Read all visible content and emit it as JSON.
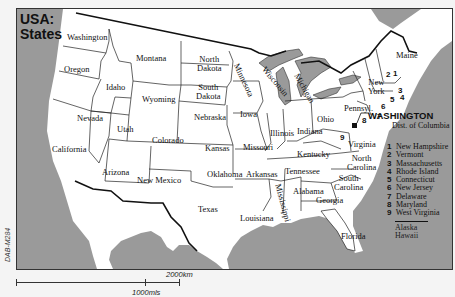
{
  "title": {
    "line1": "USA:",
    "line2": "States"
  },
  "colors": {
    "water": "#9a9a9a",
    "land": "#ffffff",
    "border": "#111111",
    "background": "#f4f4f4"
  },
  "states": {
    "washington": "Washington",
    "oregon": "Oregon",
    "california": "California",
    "nevada": "Nevada",
    "idaho": "Idaho",
    "montana": "Montana",
    "wyoming": "Wyoming",
    "utah": "Utah",
    "arizona": "Arizona",
    "colorado": "Colorado",
    "new_mexico": "New Mexico",
    "north_dakota": [
      "North",
      "Dakota"
    ],
    "south_dakota": [
      "South",
      "Dakota"
    ],
    "nebraska": "Nebraska",
    "kansas": "Kansas",
    "oklahoma": "Oklahoma",
    "texas": "Texas",
    "minnesota": "Minnesota",
    "iowa": "Iowa",
    "missouri": "Missouri",
    "arkansas": "Arkansas",
    "louisiana": "Louisiana",
    "wisconsin": "Wisconsin",
    "michigan": "Michigan",
    "illinois": "Illinois",
    "indiana": "Indiana",
    "ohio": "Ohio",
    "kentucky": "Kentucky",
    "tennessee": "Tennessee",
    "mississippi": "Mississippi",
    "alabama": "Alabama",
    "georgia": "Georgia",
    "florida": "Florida",
    "south_carolina": [
      "South",
      "Carolina"
    ],
    "north_carolina": [
      "North",
      "Carolina"
    ],
    "virginia": "Virginia",
    "pennsylvania": "Pennsyl.",
    "new_york": [
      "New",
      "York"
    ],
    "maine": "Maine"
  },
  "map_numbers": [
    "1",
    "2",
    "3",
    "4",
    "5",
    "6",
    "7",
    "8",
    "9"
  ],
  "capital": {
    "name": "WASHINGTON",
    "sub": "Dist. of Columbia"
  },
  "legend": [
    {
      "num": "1",
      "name": "New Hampshire"
    },
    {
      "num": "2",
      "name": "Vermont"
    },
    {
      "num": "3",
      "name": "Massachusetts"
    },
    {
      "num": "4",
      "name": "Rhode Island"
    },
    {
      "num": "5",
      "name": "Connecticut"
    },
    {
      "num": "6",
      "name": "New Jersey"
    },
    {
      "num": "7",
      "name": "Delaware"
    },
    {
      "num": "8",
      "name": "Maryland"
    },
    {
      "num": "9",
      "name": "West Virginia"
    }
  ],
  "legend_extra": [
    "Alaska",
    "Hawaii"
  ],
  "map_code": "DAB-M284",
  "scale": {
    "km": "2000km",
    "mi": "1000mls"
  }
}
